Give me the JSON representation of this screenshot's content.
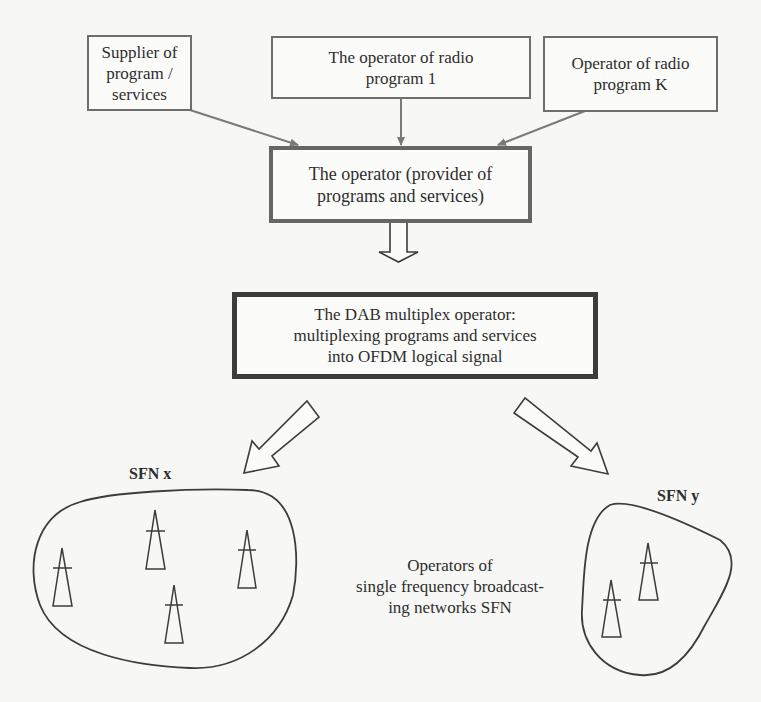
{
  "diagram": {
    "title": "",
    "sources": [
      {
        "id": "supplier",
        "text": "Supplier of\nprogram / services"
      },
      {
        "id": "radio1",
        "text": "The operator of radio\nprogram 1"
      },
      {
        "id": "radioK",
        "text": "Operator  of radio\nprogram K"
      }
    ],
    "provider": {
      "text": "The operator (provider of\nprograms and services)"
    },
    "multiplex": {
      "text": "The DAB multiplex operator:\nmultiplexing programs and services\ninto OFDM logical signal"
    },
    "networks": [
      {
        "id": "sfn-x",
        "label": "SFN x",
        "transmitters": 4
      },
      {
        "id": "sfn-y",
        "label": "SFN y",
        "transmitters": 2
      }
    ],
    "sfn_caption": "Operators of\nsingle frequency  broadcast-\ning networks SFN",
    "colors": {
      "background": "#f7f7f5",
      "line": "#3c3c3c",
      "connector": "#7a7a7a",
      "text": "#2e2e2e"
    }
  }
}
